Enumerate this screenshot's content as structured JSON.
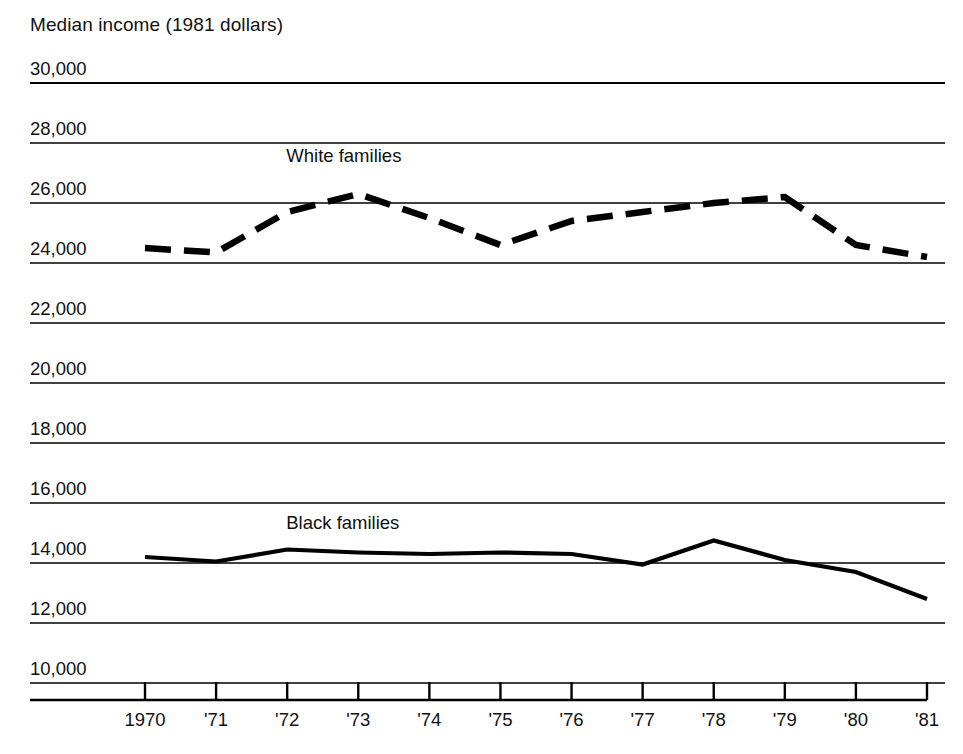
{
  "chart_data": {
    "type": "line",
    "title": "",
    "ylabel": "Median income (1981 dollars)",
    "xlabel": "",
    "ghost_text": "",
    "x": [
      "1970",
      "1971",
      "1972",
      "1973",
      "1974",
      "1975",
      "1976",
      "1977",
      "1978",
      "1979",
      "1980",
      "1981"
    ],
    "categories": [
      "1970",
      "'71",
      "'72",
      "'73",
      "'74",
      "'75",
      "'76",
      "'77",
      "'78",
      "'79",
      "'80",
      "'81"
    ],
    "ylim": [
      10000,
      30000
    ],
    "yticks": [
      30000,
      28000,
      26000,
      24000,
      22000,
      20000,
      18000,
      16000,
      14000,
      12000,
      10000
    ],
    "ytick_labels": [
      "30,000",
      "28,000",
      "26,000",
      "24,000",
      "22,000",
      "20,000",
      "18,000",
      "16,000",
      "14,000",
      "12,000",
      "10,000"
    ],
    "grid": true,
    "legend_position": "inline-annotation",
    "series": [
      {
        "name": "White families",
        "style": "dashed",
        "color": "#000000",
        "label_x": "1973",
        "values": [
          24500,
          24350,
          25700,
          26300,
          25500,
          24600,
          25400,
          25700,
          26000,
          26200,
          24600,
          24200
        ]
      },
      {
        "name": "Black families",
        "style": "solid",
        "color": "#000000",
        "label_x": "1973",
        "values": [
          14200,
          14050,
          14450,
          14350,
          14300,
          14350,
          14300,
          13950,
          14750,
          14100,
          13700,
          12800
        ]
      }
    ]
  },
  "labels": {
    "white_series": "White families",
    "black_series": "Black families"
  }
}
